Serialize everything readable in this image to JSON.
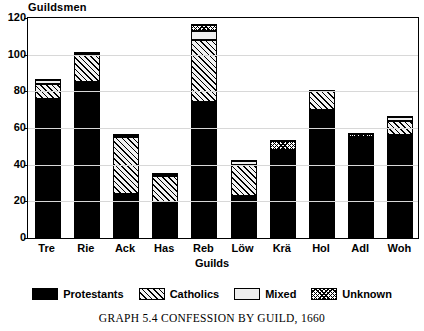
{
  "chart_data": {
    "type": "bar",
    "stacked": true,
    "title": "GRAPH 5.4   CONFESSION BY GUILD, 1660",
    "ylabel": "Guildsmen",
    "xlabel": "Guilds",
    "categories": [
      "Tre",
      "Rie",
      "Ack",
      "Has",
      "Reb",
      "Löw",
      "Krä",
      "Hol",
      "Adl",
      "Woh"
    ],
    "ylim": [
      0,
      120
    ],
    "yticks": [
      0,
      20,
      40,
      60,
      80,
      100,
      120
    ],
    "ytick_labels": [
      "0",
      "20",
      "40",
      "60",
      "80",
      "100",
      "120"
    ],
    "grid": true,
    "legend_position": "bottom",
    "series": [
      {
        "name": "Protestants",
        "fill": "solid-black",
        "color": "#000000",
        "values": [
          76,
          85,
          24,
          19,
          74,
          23,
          48,
          70,
          55,
          56
        ]
      },
      {
        "name": "Catholics",
        "fill": "diagonal-hatch",
        "color": "#f2f2f2",
        "values": [
          8,
          15,
          31,
          15,
          34,
          17,
          0,
          10,
          0,
          8
        ]
      },
      {
        "name": "Mixed",
        "fill": "light-solid",
        "color": "#eeeeee",
        "values": [
          2,
          1,
          1,
          1,
          5,
          2,
          0,
          0,
          0,
          2
        ]
      },
      {
        "name": "Unknown",
        "fill": "cross-hatch",
        "color": "#ffffff",
        "values": [
          0,
          0,
          0,
          0,
          3,
          0,
          5,
          0,
          2,
          0
        ]
      }
    ],
    "totals": [
      86,
      101,
      56,
      35,
      116,
      42,
      53,
      80,
      57,
      66
    ]
  }
}
